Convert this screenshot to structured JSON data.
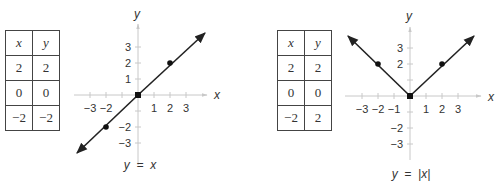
{
  "figures": [
    {
      "table": {
        "headers": [
          "x",
          "y"
        ],
        "rows": [
          [
            "2",
            "2"
          ],
          [
            "0",
            "0"
          ],
          [
            "−2",
            "−2"
          ]
        ]
      },
      "graph": {
        "x_axis_label": "x",
        "y_axis_label": "y",
        "x_tick_labels_neg": [
          "−3",
          "−2"
        ],
        "x_tick_labels_pos": [
          "1",
          "2",
          "3"
        ],
        "y_tick_labels_pos": [
          "3",
          "2",
          "1"
        ],
        "y_tick_labels_neg": [
          "−2",
          "−3"
        ],
        "caption": "y  =  x"
      }
    },
    {
      "table": {
        "headers": [
          "x",
          "y"
        ],
        "rows": [
          [
            "2",
            "2"
          ],
          [
            "0",
            "0"
          ],
          [
            "−2",
            "2"
          ]
        ]
      },
      "graph": {
        "x_axis_label": "x",
        "y_axis_label": "y",
        "x_tick_labels_neg": [
          "−3",
          "−2",
          "−1"
        ],
        "x_tick_labels_pos": [
          "1",
          "2",
          "3"
        ],
        "y_tick_labels_pos": [
          "3",
          "2"
        ],
        "y_tick_labels_neg": [
          "−2",
          "−3"
        ],
        "caption": "y  =  |x|"
      }
    }
  ]
}
